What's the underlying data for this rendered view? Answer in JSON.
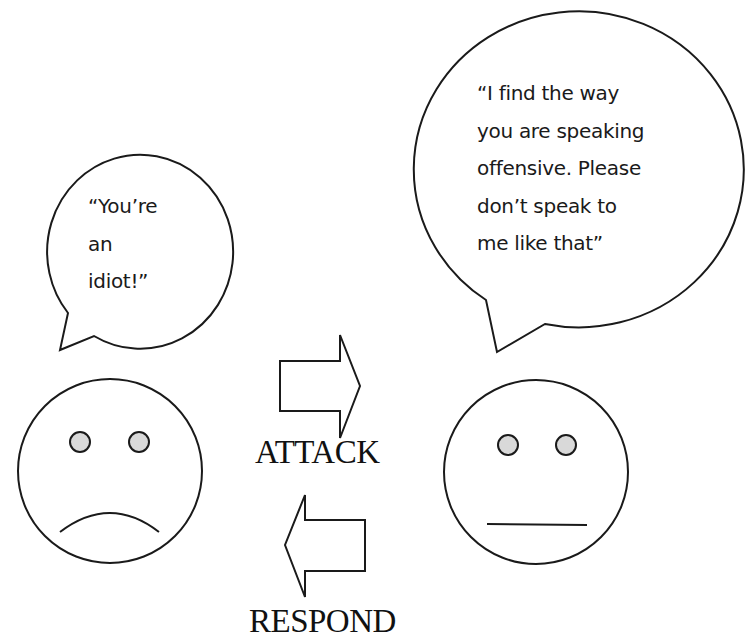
{
  "diagram": {
    "attacker": {
      "expression": "sad",
      "speech_lines": [
        "“You’re",
        "an",
        "idiot!”"
      ]
    },
    "responder": {
      "expression": "neutral",
      "speech_lines": [
        "“I find the way",
        "you are speaking",
        "offensive. Please",
        "don’t speak to",
        "me like that”"
      ]
    },
    "arrows": {
      "attack": {
        "direction": "right",
        "label": "ATTACK"
      },
      "respond": {
        "direction": "left",
        "label": "RESPOND"
      }
    },
    "colors": {
      "stroke": "#1a1a1a",
      "eye_fill": "#d9d9d9",
      "background": "#ffffff"
    }
  }
}
